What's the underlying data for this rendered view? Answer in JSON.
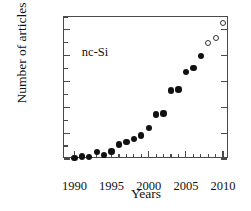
{
  "chart_data": {
    "type": "scatter",
    "title": "",
    "xlabel": "Years",
    "ylabel": "Number of articles",
    "annotation": "nc-Si",
    "xlim": [
      1988.6,
      2010.8
    ],
    "ylim": [
      0,
      1100
    ],
    "grid": false,
    "legend": "none",
    "xticks": [
      1990,
      1995,
      2000,
      2005,
      2010
    ],
    "xtick_labels": [
      "1990",
      "1995",
      "2000",
      "2005",
      "2010"
    ],
    "xminor_ticks": [
      1991,
      1992,
      1993,
      1994,
      1996,
      1997,
      1998,
      1999,
      2001,
      2002,
      2003,
      2004,
      2006,
      2007,
      2008,
      2009
    ],
    "yticks": [
      0,
      200,
      400,
      600,
      800,
      1000
    ],
    "ytick_labels": [
      "0",
      "200",
      "400",
      "600",
      "800",
      "1000"
    ],
    "yminor_ticks": [
      100,
      300,
      500,
      700,
      900,
      1100
    ],
    "series": [
      {
        "name": "published articles",
        "marker": "filled-circle",
        "color": "#111111",
        "x": [
          1990,
          1991,
          1992,
          1993,
          1994,
          1995,
          1996,
          1997,
          1998,
          1999,
          2000,
          2001,
          2002,
          2003,
          2004,
          2005,
          2006,
          2007
        ],
        "values": [
          8,
          18,
          15,
          52,
          30,
          57,
          112,
          133,
          155,
          182,
          238,
          345,
          352,
          532,
          538,
          672,
          705,
          800
        ]
      },
      {
        "name": "estimated articles",
        "marker": "open-circle",
        "color": "#333333",
        "x": [
          2008,
          2009,
          2010
        ],
        "values": [
          898,
          935,
          1055
        ]
      }
    ]
  }
}
